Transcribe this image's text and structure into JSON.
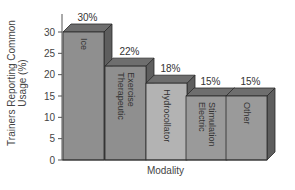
{
  "chart_data": {
    "type": "bar",
    "style": "3d",
    "title": "",
    "xlabel": "Modality",
    "ylabel": "Trainers Reporting Common Usage (%)",
    "categories": [
      "Ice",
      "Therapeutic Exercise",
      "Hydrocollator",
      "Electric Stimulation",
      "Other"
    ],
    "values": [
      30,
      22,
      18,
      15,
      15
    ],
    "value_labels": [
      "30%",
      "22%",
      "18%",
      "15%",
      "15%"
    ],
    "bar_label_lines": [
      [
        "Ice"
      ],
      [
        "Therapeutic",
        "Exercise"
      ],
      [
        "Hydrocollator"
      ],
      [
        "Electric",
        "Stimulation"
      ],
      [
        "Other"
      ]
    ],
    "yticks": [
      0,
      5,
      10,
      15,
      20,
      25,
      30
    ],
    "ylim": [
      0,
      32
    ],
    "grid": false,
    "legend": "none",
    "colors": {
      "front": [
        "#8f8f8f",
        "#8f8f8f",
        "#b3b3b3",
        "#9a9a9a",
        "#9a9a9a"
      ],
      "top": "#6e6e6e",
      "side": "#5e5e5e",
      "edge": "#2a2a2a"
    }
  }
}
